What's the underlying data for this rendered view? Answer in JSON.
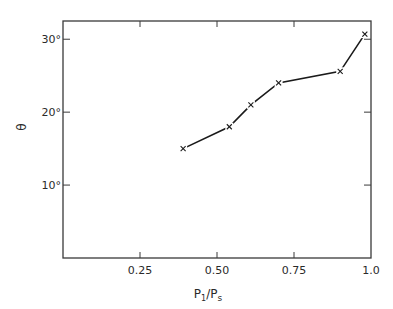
{
  "chart_data": {
    "type": "line",
    "title": "",
    "xlabel": "P1/Ps",
    "xlabel_parts": {
      "main": "P",
      "sub1": "1",
      "slash": "/",
      "main2": "P",
      "sub2": "s"
    },
    "ylabel": "θ",
    "xlim": [
      0,
      1.0
    ],
    "ylim": [
      0,
      32.5
    ],
    "grid": false,
    "legend": null,
    "x_ticks": [
      {
        "value": 0.25,
        "label": "0.25"
      },
      {
        "value": 0.5,
        "label": "0.50"
      },
      {
        "value": 0.75,
        "label": "0.75"
      },
      {
        "value": 1.0,
        "label": "1.0"
      }
    ],
    "y_ticks": [
      {
        "value": 10,
        "label": "10°"
      },
      {
        "value": 20,
        "label": "20°"
      },
      {
        "value": 30,
        "label": "30°"
      }
    ],
    "series": [
      {
        "name": "theta vs pressure ratio",
        "marker": "x",
        "x": [
          0.39,
          0.54,
          0.61,
          0.7,
          0.9,
          0.98
        ],
        "y": [
          15.0,
          18.0,
          21.0,
          24.0,
          25.6,
          30.7
        ]
      }
    ]
  }
}
